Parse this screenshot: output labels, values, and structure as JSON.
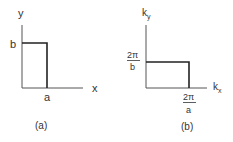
{
  "panel_a": {
    "caption": "(a)",
    "y_axis_label": "y",
    "x_axis_label": "x",
    "height_label": "b",
    "width_label": "a"
  },
  "panel_b": {
    "caption": "(b)",
    "y_axis_label_main": "k",
    "y_axis_label_sub": "y",
    "x_axis_label_main": "k",
    "x_axis_label_sub": "x",
    "height_label_num": "2π",
    "height_label_den": "b",
    "width_label_num": "2π",
    "width_label_den": "a"
  },
  "colors": {
    "axis": "#555555",
    "rectangle": "#222222",
    "text": "#333333"
  }
}
